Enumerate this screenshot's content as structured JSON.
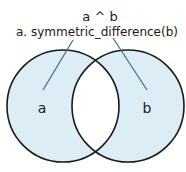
{
  "diagram": {
    "title_line1": "a ^ b",
    "title_line2": "a. symmetric_difference(b)",
    "set_a_label": "a",
    "set_b_label": "b",
    "colors": {
      "fill": "#dcedf6",
      "outline": "#1a1a1a",
      "leader": "#4a6f95",
      "background": "#ffffff"
    }
  }
}
